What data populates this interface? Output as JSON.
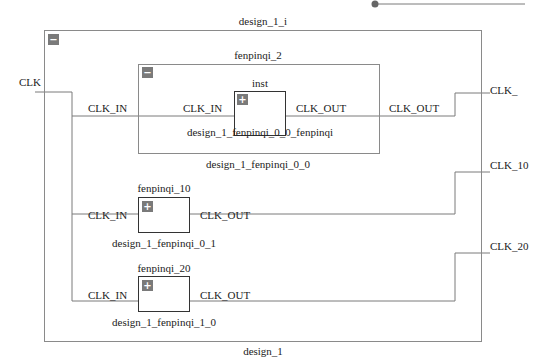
{
  "design": {
    "instance_label": "design_1_i",
    "type_label": "design_1",
    "collapse_icon": "−"
  },
  "ports": {
    "input": "CLK",
    "outputs": [
      "CLK_",
      "CLK_10",
      "CLK_20"
    ]
  },
  "hier_cell": {
    "instance_label": "fenpinqi_2",
    "type_label": "design_1_fenpinqi_0_0",
    "collapse_icon": "−",
    "pin_in": "CLK_IN",
    "pin_out": "CLK_OUT",
    "inner_cell": {
      "instance_label": "inst",
      "type_label": "design_1_fenpinqi_0_0_fenpinqi",
      "expand_icon": "+",
      "pin_in": "CLK_IN",
      "pin_out": "CLK_OUT"
    }
  },
  "cells": [
    {
      "instance_label": "fenpinqi_10",
      "type_label": "design_1_fenpinqi_0_1",
      "expand_icon": "+",
      "pin_in": "CLK_IN",
      "pin_out": "CLK_OUT"
    },
    {
      "instance_label": "fenpinqi_20",
      "type_label": "design_1_fenpinqi_1_0",
      "expand_icon": "+",
      "pin_in": "CLK_IN",
      "pin_out": "CLK_OUT"
    }
  ],
  "colors": {
    "wire": "#7a7a7a",
    "hier_border": "#8a8a8a",
    "cell_border": "#333333",
    "toggle_bg": "#7a7a7a"
  }
}
